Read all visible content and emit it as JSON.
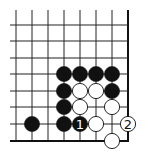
{
  "diagram": {
    "type": "go-board-corner",
    "colors": {
      "background": "#ffffff",
      "line": "#222222",
      "black": "#111111",
      "white": "#ffffff",
      "edge": "#111111"
    },
    "grid": {
      "x": [
        16,
        32,
        48,
        64,
        80,
        96,
        112,
        128
      ],
      "y": [
        25,
        41,
        58,
        74,
        91,
        107,
        124,
        141
      ],
      "right_edge_x": 128,
      "bottom_edge_y": 141,
      "open_top": true,
      "open_left": true
    },
    "stones": [
      {
        "color": "black",
        "col": 3,
        "row": 3,
        "label": ""
      },
      {
        "color": "black",
        "col": 4,
        "row": 3,
        "label": ""
      },
      {
        "color": "black",
        "col": 5,
        "row": 3,
        "label": ""
      },
      {
        "color": "black",
        "col": 6,
        "row": 3,
        "label": ""
      },
      {
        "color": "black",
        "col": 3,
        "row": 4,
        "label": ""
      },
      {
        "color": "white",
        "col": 4,
        "row": 4,
        "label": ""
      },
      {
        "color": "white",
        "col": 5,
        "row": 4,
        "label": ""
      },
      {
        "color": "black",
        "col": 6,
        "row": 4,
        "label": ""
      },
      {
        "color": "black",
        "col": 3,
        "row": 5,
        "label": ""
      },
      {
        "color": "white",
        "col": 4,
        "row": 5,
        "label": ""
      },
      {
        "color": "white",
        "col": 6,
        "row": 5,
        "label": ""
      },
      {
        "color": "black",
        "col": 1,
        "row": 6,
        "label": ""
      },
      {
        "color": "black",
        "col": 3,
        "row": 6,
        "label": ""
      },
      {
        "color": "black",
        "col": 4,
        "row": 6,
        "label": "1"
      },
      {
        "color": "white",
        "col": 5,
        "row": 6,
        "label": ""
      },
      {
        "color": "white",
        "col": 7,
        "row": 6,
        "label": "2"
      },
      {
        "color": "white",
        "col": 6,
        "row": 7,
        "label": ""
      }
    ]
  }
}
